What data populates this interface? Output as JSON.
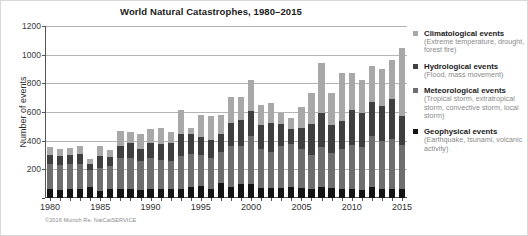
{
  "chart_data": {
    "type": "bar",
    "subtype": "stacked-bar",
    "title": "World Natural Catastrophes, 1980–2015",
    "xlabel": "",
    "ylabel": "Number of events",
    "ylim": [
      0,
      1200
    ],
    "ytick_values": [
      0,
      200,
      400,
      600,
      800,
      1000,
      1200
    ],
    "ytick_labels": [
      "0",
      "200",
      "400",
      "600",
      "800",
      "1000",
      "1200"
    ],
    "grid": true,
    "legend_position": "right",
    "categories": [
      "1980",
      "1981",
      "1982",
      "1983",
      "1984",
      "1985",
      "1986",
      "1987",
      "1988",
      "1989",
      "1990",
      "1991",
      "1992",
      "1993",
      "1994",
      "1995",
      "1996",
      "1997",
      "1998",
      "1999",
      "2000",
      "2001",
      "2002",
      "2003",
      "2004",
      "2005",
      "2006",
      "2007",
      "2008",
      "2009",
      "2010",
      "2011",
      "2012",
      "2013",
      "2014",
      "2015"
    ],
    "xtick_labels": [
      "1980",
      "1985",
      "1990",
      "1995",
      "2000",
      "2005",
      "2010",
      "2015"
    ],
    "series": [
      {
        "name": "Geophysical events",
        "color": "#141414",
        "values": [
          65,
          55,
          60,
          60,
          75,
          50,
          60,
          60,
          60,
          55,
          65,
          60,
          60,
          65,
          75,
          85,
          60,
          105,
          80,
          95,
          100,
          70,
          70,
          70,
          75,
          70,
          65,
          75,
          70,
          65,
          65,
          55,
          80,
          65,
          60,
          65
        ]
      },
      {
        "name": "Meteorological events",
        "color": "#6e6e6e",
        "values": [
          170,
          175,
          180,
          180,
          120,
          160,
          160,
          220,
          220,
          200,
          215,
          205,
          195,
          225,
          230,
          215,
          220,
          215,
          280,
          270,
          330,
          270,
          250,
          290,
          300,
          270,
          235,
          280,
          245,
          280,
          305,
          300,
          350,
          330,
          350,
          305
        ]
      },
      {
        "name": "Hydrological events",
        "color": "#3f3f3f",
        "values": [
          65,
          60,
          60,
          70,
          45,
          80,
          65,
          85,
          105,
          90,
          105,
          115,
          130,
          160,
          140,
          125,
          125,
          130,
          165,
          180,
          180,
          170,
          200,
          155,
          105,
          150,
          215,
          235,
          195,
          190,
          245,
          240,
          240,
          245,
          280,
          200
        ]
      },
      {
        "name": "Climatological events",
        "color": "#a8a8a8",
        "values": [
          55,
          50,
          50,
          55,
          30,
          75,
          50,
          105,
          75,
          100,
          100,
          110,
          75,
          165,
          45,
          155,
          170,
          130,
          180,
          160,
          215,
          140,
          145,
          75,
          75,
          145,
          215,
          355,
          220,
          335,
          255,
          230,
          250,
          260,
          275,
          475
        ]
      }
    ],
    "totals": [
      355,
      340,
      350,
      365,
      270,
      365,
      335,
      470,
      460,
      445,
      485,
      490,
      460,
      615,
      490,
      580,
      575,
      580,
      705,
      705,
      825,
      650,
      665,
      590,
      555,
      635,
      730,
      945,
      730,
      870,
      870,
      825,
      920,
      900,
      965,
      1045
    ],
    "annotations": []
  },
  "legend": {
    "items": [
      {
        "label": "Climatological events",
        "description": "(Extreme temperature, drought, forest fire)",
        "color": "#a8a8a8",
        "swatch_name": "legend-swatch-climatological"
      },
      {
        "label": "Hydrological events",
        "description": "(Flood, mass movement)",
        "color": "#3f3f3f",
        "swatch_name": "legend-swatch-hydrological"
      },
      {
        "label": "Meteorological events",
        "description": "(Tropical storm, extratropical storm, convective storm, local storm)",
        "color": "#6e6e6e",
        "swatch_name": "legend-swatch-meteorological"
      },
      {
        "label": "Geophysical events",
        "description": "(Earthquake, tsunami, volcanic activity)",
        "color": "#141414",
        "swatch_name": "legend-swatch-geophysical"
      }
    ]
  },
  "credit": "©2016 Munich Re, NatCatSERVICE"
}
